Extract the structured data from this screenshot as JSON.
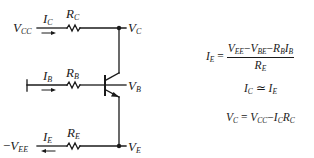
{
  "diagram": {
    "type": "transistor-bias-circuit",
    "labels": {
      "vcc": {
        "main": "V",
        "sub": "CC"
      },
      "ic": {
        "main": "I",
        "sub": "C"
      },
      "rc": {
        "main": "R",
        "sub": "C"
      },
      "vc": {
        "main": "V",
        "sub": "C"
      },
      "ib": {
        "main": "I",
        "sub": "B"
      },
      "rb": {
        "main": "R",
        "sub": "B"
      },
      "vb": {
        "main": "V",
        "sub": "B"
      },
      "vee": {
        "prefix": "−",
        "main": "V",
        "sub": "EE"
      },
      "ie": {
        "main": "I",
        "sub": "E"
      },
      "re": {
        "main": "R",
        "sub": "E"
      },
      "ve": {
        "main": "V",
        "sub": "E"
      }
    },
    "current_arrows": {
      "ic": "right",
      "ib": "right",
      "ie": "left"
    }
  },
  "equations": {
    "eq1": {
      "lhs_main": "I",
      "lhs_sub": "E",
      "equals": "=",
      "num": [
        {
          "main": "V",
          "sub": "EE"
        },
        {
          "op": "−"
        },
        {
          "main": "V",
          "sub": "BE"
        },
        {
          "op": "−"
        },
        {
          "main": "R",
          "sub": "B"
        },
        {
          "main": "I",
          "sub": "B"
        }
      ],
      "den": {
        "main": "R",
        "sub": "E"
      }
    },
    "eq2": {
      "lhs_main": "I",
      "lhs_sub": "C",
      "approx": "≃",
      "rhs_main": "I",
      "rhs_sub": "E"
    },
    "eq3": {
      "lhs_main": "V",
      "lhs_sub": "C",
      "equals": "=",
      "t1_main": "V",
      "t1_sub": "CC",
      "minus": "−",
      "t2_main": "I",
      "t2_sub": "C",
      "t3_main": "R",
      "t3_sub": "C"
    }
  }
}
